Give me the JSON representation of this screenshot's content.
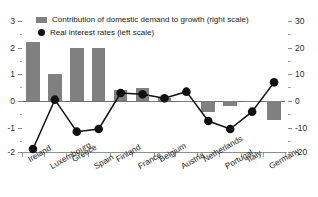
{
  "chart_data": {
    "type": "bar",
    "title": "",
    "subtitle": "",
    "xlabel": "",
    "ylabel": "",
    "categories": [
      "Ireland",
      "Luxembourg",
      "Greece",
      "Spain",
      "Finland",
      "France",
      "Belgium",
      "Austria",
      "Netherlands",
      "Portugal",
      "Italy",
      "Germany"
    ],
    "series": [
      {
        "name": "Contribution of domestic demand to growth (right scale)",
        "type": "bar",
        "axis": "right",
        "color": "#808080",
        "values": [
          22,
          10,
          20,
          20,
          4,
          5,
          1,
          0,
          -4,
          -2,
          -0.5,
          -7
        ]
      },
      {
        "name": "Real interest rates (left scale)",
        "type": "line",
        "axis": "left",
        "color": "#111111",
        "marker": "circle",
        "values": [
          -1.8,
          0.05,
          -1.15,
          -1.05,
          0.3,
          0.25,
          0.1,
          0.35,
          -0.75,
          -1.05,
          -0.4,
          0.7
        ]
      }
    ],
    "left_axis": {
      "label": "",
      "ylim": [
        -2,
        3
      ],
      "ticks": [
        3,
        2,
        1,
        0,
        -1,
        -2
      ],
      "tick_labels": [
        "3",
        "2",
        "1",
        "0",
        "-1",
        "-2"
      ],
      "minor_ticks": [
        2.5,
        1.5,
        0.5,
        -0.5,
        -1.5
      ]
    },
    "right_axis": {
      "label": "",
      "ylim": [
        -20,
        30
      ],
      "ticks": [
        30,
        20,
        10,
        0,
        -10,
        -20
      ],
      "tick_labels": [
        "30",
        "20",
        "10",
        "0",
        "-10",
        "-20"
      ],
      "minor_ticks": [
        25,
        15,
        5,
        -5,
        -15
      ]
    },
    "grid": false,
    "legend_position": "top-left",
    "legend": [
      {
        "label": "Contribution of domestic demand to growth (right scale)",
        "marker": "bar",
        "color": "#808080"
      },
      {
        "label": "Real interest rates (left scale)",
        "marker": "circle",
        "color": "#111111"
      }
    ]
  },
  "colors": {
    "bar": "#808080",
    "line": "#111111",
    "axis": "#8a8a8a",
    "text": "#222222",
    "background": "#ffffff"
  }
}
